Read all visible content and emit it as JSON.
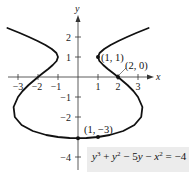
{
  "chart_data": {
    "type": "line",
    "title": "",
    "equation": "y^3 + y^2 - 5y - x^2 = -4",
    "equation_display": {
      "lhs": [
        "y",
        "3",
        " + ",
        "y",
        "2",
        " − 5",
        "y",
        " − ",
        "x",
        "2"
      ],
      "rhs": " = −4"
    },
    "xlabel": "x",
    "ylabel": "y",
    "xlim": [
      -3.5,
      3.5
    ],
    "ylim": [
      -4.5,
      2.8
    ],
    "grid": false,
    "x_ticks": [
      -3,
      -2,
      -1,
      1,
      2,
      3
    ],
    "x_tick_labels": [
      "−3",
      "−2",
      "−1",
      "1",
      "2",
      "3"
    ],
    "y_ticks": [
      2,
      1,
      -1,
      -2,
      -4
    ],
    "y_tick_labels": [
      "2",
      "1",
      "−1",
      "−2",
      "−4"
    ],
    "series": [
      {
        "name": "curve",
        "description": "x = ±sqrt(y^3 + y^2 - 5y + 4); right branch, left branch mirror",
        "right_branch": [
          [
            3.53,
            2.45
          ],
          [
            2.91,
            2.2
          ],
          [
            2.45,
            2.0
          ],
          [
            2.02,
            1.8
          ],
          [
            1.63,
            1.6
          ],
          [
            1.31,
            1.4
          ],
          [
            1.08,
            1.2
          ],
          [
            1.0,
            1.0
          ],
          [
            1.07,
            0.8
          ],
          [
            1.26,
            0.6
          ],
          [
            1.49,
            0.4
          ],
          [
            1.75,
            0.2
          ],
          [
            2.0,
            0.0
          ],
          [
            2.47,
            -0.4
          ],
          [
            2.77,
            -0.7
          ],
          [
            3.0,
            -1.0
          ],
          [
            3.22,
            -1.5
          ],
          [
            3.16,
            -2.0
          ],
          [
            2.82,
            -2.4
          ],
          [
            2.26,
            -2.7
          ],
          [
            1.59,
            -2.9
          ],
          [
            1.0,
            -3.0
          ],
          [
            0.42,
            -3.05
          ],
          [
            0.0,
            -3.058
          ]
        ]
      }
    ],
    "points": [
      {
        "label": "(1, 1)",
        "x": 1,
        "y": 1
      },
      {
        "label": "(2, 0)",
        "x": 2,
        "y": 0
      },
      {
        "label": "(1, −3)",
        "x": 1,
        "y": -3
      },
      {
        "label": "",
        "x": 0,
        "y": -3.058
      }
    ]
  },
  "labels": {
    "x_axis": "x",
    "y_axis": "y",
    "pt_1_1": "(1, 1)",
    "pt_2_0": "(2, 0)",
    "pt_1_m3": "(1, −3)",
    "eq": {
      "y1": "y",
      "e1": "3",
      "op1": " + ",
      "y2": "y",
      "e2": "2",
      "op2": " − 5",
      "y3": "y",
      "op3": " − ",
      "x1": "x",
      "e3": "2",
      "rhs": " = −4"
    }
  }
}
